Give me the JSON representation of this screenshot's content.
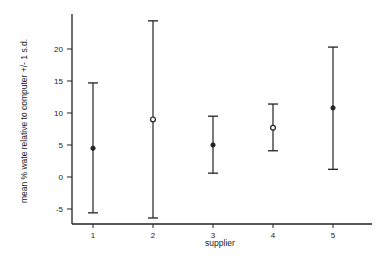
{
  "chart_data": {
    "type": "scatter",
    "subtype": "errorbar",
    "title": "",
    "xlabel": "supplier",
    "ylabel": "mean % wate relative to computer +/- 1 s.d.",
    "categories": [
      "1",
      "2",
      "3",
      "4",
      "5"
    ],
    "x": [
      1,
      2,
      3,
      4,
      5
    ],
    "series": [
      {
        "name": "mean +/- 1 s.d.",
        "mean": [
          4.5,
          9.0,
          5.0,
          7.7,
          10.8
        ],
        "upper": [
          14.7,
          24.4,
          9.5,
          11.4,
          20.3
        ],
        "lower": [
          -5.6,
          -6.4,
          0.6,
          4.1,
          1.2
        ],
        "marker_fill": [
          "filled",
          "hollow",
          "filled",
          "hollow",
          "filled"
        ]
      }
    ],
    "yticks": [
      -5,
      0,
      5,
      10,
      15,
      20
    ],
    "ytick_labels": [
      "-5",
      "0",
      "5",
      "10",
      "15",
      "20"
    ],
    "xticks": [
      1,
      2,
      3,
      4,
      5
    ],
    "xtick_labels": [
      "1",
      "2",
      "3",
      "4",
      "5"
    ],
    "ylim": [
      -7.3,
      25.5
    ],
    "xlim": [
      0.35,
      5.65
    ],
    "grid": false,
    "legend": null
  },
  "colors": {
    "ink": "#222222",
    "background": "#ffffff"
  }
}
